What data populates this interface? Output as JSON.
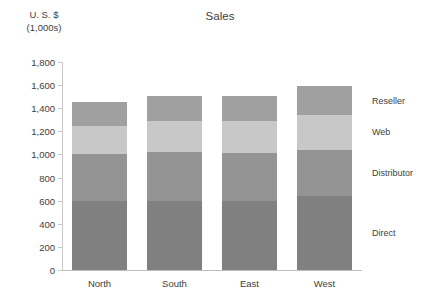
{
  "chart_data": {
    "type": "bar",
    "subtype": "stacked-column",
    "title": "Sales",
    "xlabel": "",
    "ylabel": "U. S. $ (1,000s)",
    "ylabel_lines": [
      "U. S. $",
      "(1,000s)"
    ],
    "categories": [
      "North",
      "South",
      "East",
      "West"
    ],
    "series": [
      {
        "name": "Direct",
        "values": [
          600,
          600,
          600,
          640
        ],
        "color": "#808080"
      },
      {
        "name": "Distributor",
        "values": [
          400,
          420,
          410,
          400
        ],
        "color": "#949494"
      },
      {
        "name": "Web",
        "values": [
          250,
          270,
          280,
          300
        ],
        "color": "#c8c8c8"
      },
      {
        "name": "Reseller",
        "values": [
          200,
          220,
          220,
          250
        ],
        "color": "#a0a0a0"
      }
    ],
    "totals": [
      1450,
      1510,
      1510,
      1590
    ],
    "ylim": [
      0,
      1800
    ],
    "ytick_step": 200,
    "yticks": [
      0,
      200,
      400,
      600,
      800,
      1000,
      1200,
      1400,
      1600,
      1800
    ],
    "ytick_labels": [
      "0",
      "200",
      "400",
      "600",
      "800",
      "1,000",
      "1,200",
      "1,400",
      "1,600",
      "1,800"
    ],
    "grid": false,
    "legend_position": "right-inline",
    "legend_entries": [
      "Reseller",
      "Web",
      "Distributor",
      "Direct"
    ],
    "axis_color": "#c9c9c9",
    "text_color": "#404040",
    "background": "#ffffff"
  }
}
